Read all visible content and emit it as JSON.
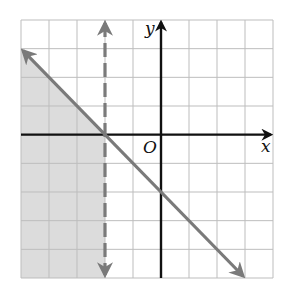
{
  "chart_data": {
    "type": "line",
    "title": "",
    "xlabel": "x",
    "ylabel": "y",
    "origin_label": "O",
    "xlim": [
      -5,
      4
    ],
    "ylim": [
      -5,
      4
    ],
    "grid": true,
    "grid_step": 1,
    "series": [
      {
        "name": "boundary y = -x - 2",
        "style": "solid",
        "arrows": "both",
        "equation": "y = -x - 2",
        "points": [
          [
            -5,
            3
          ],
          [
            3,
            -5
          ]
        ]
      },
      {
        "name": "boundary x = -2",
        "style": "dashed",
        "arrows": "both",
        "equation": "x = -2",
        "points": [
          [
            -2,
            4
          ],
          [
            -2,
            -5
          ]
        ]
      }
    ],
    "shaded_region": {
      "inequalities": [
        "y <= -x - 2",
        "x < -2"
      ],
      "polygon": [
        [
          -5,
          3
        ],
        [
          -2,
          0
        ],
        [
          -2,
          -5
        ],
        [
          -5,
          -5
        ]
      ]
    }
  },
  "colors": {
    "grid": "#bdbdbd",
    "axis": "#111111",
    "boundary": "#7a7a7a",
    "shade": "#dcdcdc"
  },
  "labels": {
    "x": "x",
    "y": "y",
    "origin": "O"
  }
}
